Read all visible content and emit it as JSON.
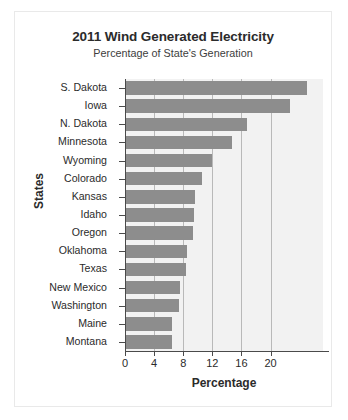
{
  "chart_data": {
    "type": "bar",
    "orientation": "horizontal",
    "title": "2011 Wind Generated Electricity",
    "subtitle": "Percentage of State's Generation",
    "xlabel": "Percentage",
    "ylabel": "States",
    "categories": [
      "S. Dakota",
      "Iowa",
      "N. Dakota",
      "Minnesota",
      "Wyoming",
      "Colorado",
      "Kansas",
      "Idaho",
      "Oregon",
      "Oklahoma",
      "Texas",
      "New Mexico",
      "Washington",
      "Maine",
      "Montana"
    ],
    "values": [
      25.0,
      22.6,
      16.8,
      14.7,
      12.0,
      10.6,
      9.6,
      9.5,
      9.4,
      8.5,
      8.4,
      7.5,
      7.4,
      6.5,
      6.4
    ],
    "xlim": [
      0,
      27.2
    ],
    "xticks": [
      0,
      4,
      8,
      12,
      16,
      20
    ],
    "xticklabels": [
      "0",
      "4",
      "8",
      "12",
      "16",
      "20"
    ],
    "grid": "vertical",
    "legend": "none",
    "bar_color": "#8d8d8d",
    "plot_background": "#f2f2f2",
    "axis_color": "#4a4a4a",
    "gridline_color": "#b9b9b9"
  }
}
